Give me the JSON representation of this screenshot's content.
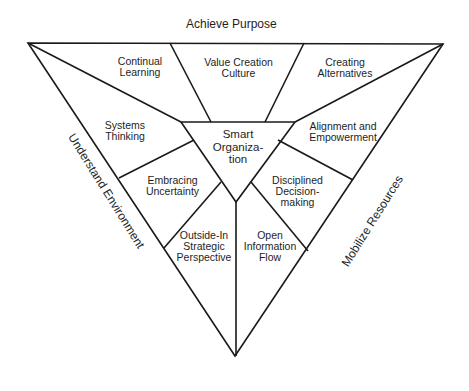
{
  "diagram": {
    "top_label": "Achieve Purpose",
    "left_label": "Understand Environment",
    "right_label": "Mobilize Resources",
    "center": "Smart\nOrganiza-\ntion",
    "segments": [
      {
        "id": "continual-learning",
        "label": "Continual\nLearning"
      },
      {
        "id": "value-creation-culture",
        "label": "Value Creation\nCulture"
      },
      {
        "id": "creating-alternatives",
        "label": "Creating\nAlternatives"
      },
      {
        "id": "systems-thinking",
        "label": "Systems\nThinking"
      },
      {
        "id": "alignment-empowerment",
        "label": "Alignment and\nEmpowerment"
      },
      {
        "id": "embracing-uncertainty",
        "label": "Embracing\nUncertainty"
      },
      {
        "id": "disciplined-decision-making",
        "label": "Disciplined\nDecision-\nmaking"
      },
      {
        "id": "outside-in-strategic-perspective",
        "label": "Outside-In\nStrategic\nPerspective"
      },
      {
        "id": "open-information-flow",
        "label": "Open\nInformation\nFlow"
      }
    ],
    "line_color": "#1a1a1a"
  }
}
